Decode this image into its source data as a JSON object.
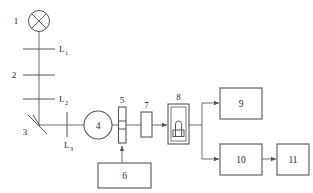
{
  "diagram": {
    "type": "block-optical-schematic",
    "background_color": "#ffffff",
    "line_color": "#575757",
    "text_color": "#2b2b2b",
    "labels": {
      "lamp": "1",
      "aperture": "2",
      "mirror": "3",
      "chopper_wheel": "4",
      "modulator": "5",
      "driver_unit": "6",
      "filter": "7",
      "sample_cell": "8",
      "detector_a": "9",
      "detector_b": "10",
      "readout": "11",
      "lens_1_base": "L",
      "lens_1_sub": "1",
      "lens_2_base": "L",
      "lens_2_sub": "2",
      "lens_3_base": "L",
      "lens_3_sub": "3"
    },
    "components": [
      {
        "id": "1",
        "name": "light-source-lamp",
        "shape": "circle-with-x"
      },
      {
        "id": "L1",
        "name": "lens-1",
        "shape": "horizontal-line"
      },
      {
        "id": "2",
        "name": "aperture-slit",
        "shape": "horizontal-line"
      },
      {
        "id": "L2",
        "name": "lens-2",
        "shape": "horizontal-line"
      },
      {
        "id": "3",
        "name": "folding-mirror",
        "shape": "diagonal-line"
      },
      {
        "id": "L3",
        "name": "lens-3",
        "shape": "vertical-line"
      },
      {
        "id": "4",
        "name": "rotating-disc",
        "shape": "circle"
      },
      {
        "id": "5",
        "name": "modulator-slit",
        "shape": "tall-narrow-rect"
      },
      {
        "id": "6",
        "name": "control-unit",
        "shape": "rect"
      },
      {
        "id": "7",
        "name": "optical-filter",
        "shape": "small-rect"
      },
      {
        "id": "8",
        "name": "sample-cell",
        "shape": "rect-with-flask"
      },
      {
        "id": "9",
        "name": "output-block-9",
        "shape": "rect"
      },
      {
        "id": "10",
        "name": "output-block-10",
        "shape": "rect"
      },
      {
        "id": "11",
        "name": "output-block-11",
        "shape": "rect"
      }
    ]
  }
}
